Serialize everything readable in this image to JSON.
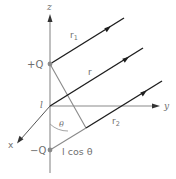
{
  "figure": {
    "type": "electric dipole geometry",
    "colors": {
      "axis": "#8a8a8a",
      "ray": "#1e1e1e",
      "label": "#6f6f6f",
      "charge_dot": "#8a8a8a"
    },
    "axes": {
      "z_label": "z",
      "y_label": "y",
      "x_label": "x"
    },
    "charges": {
      "positive_label": "+Q",
      "negative_label": "−Q"
    },
    "origin_label": "l",
    "rays": {
      "r1_label": "r",
      "r1_subscript": "1",
      "r_label": "r",
      "r2_label": "r",
      "r2_subscript": "2"
    },
    "angle_label": "θ",
    "projection_label": "l cos θ"
  }
}
